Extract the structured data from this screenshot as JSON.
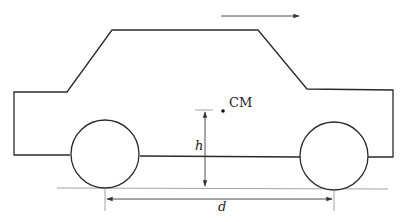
{
  "diagram": {
    "type": "car-free-body-geometry",
    "labels": {
      "center_of_mass": "CM",
      "height": "h",
      "wheelbase": "d"
    },
    "colors": {
      "stroke": "#2a2a2a",
      "guide": "#8a8a8a",
      "background": "#ffffff"
    },
    "elements": [
      "car-body-outline",
      "front-wheel",
      "rear-wheel",
      "motion-arrow",
      "center-of-mass-dot",
      "height-dimension-arrow",
      "wheelbase-dimension-arrow",
      "ground-line"
    ]
  }
}
